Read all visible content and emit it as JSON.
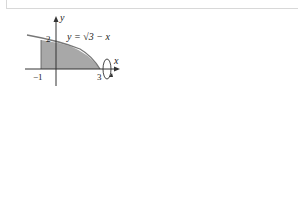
{
  "header": {
    "truncated_text": "...gure"
  },
  "figures": [
    {
      "number": "1.",
      "equation_label": "y = √(3 − x)",
      "axis_x_label": "x",
      "axis_y_label": "y",
      "tick_labels": {
        "x_neg": "−1",
        "x_pos": "3",
        "y": "2"
      },
      "rotation_axis": "x-axis",
      "region": "under y = √(3 − x) from x = −1 to x = 3"
    },
    {
      "number": "2.",
      "equation_labels": [
        "y = x",
        "y = 2 − x²"
      ],
      "axis_x_label": "x",
      "axis_y_label": "y",
      "tick_labels": {
        "x": "1",
        "y": "2"
      },
      "rotation_axis": "x-axis",
      "region": "between y = x and y = 2 − x² for 0 ≤ x ≤ 1"
    },
    {
      "number": "3.",
      "equation_label": "y = 3 − 2x",
      "axis_x_label": "x",
      "axis_y_label": "y",
      "tick_labels": {
        "x": "2",
        "y": "2"
      },
      "rotation_axis": "y-axis",
      "region": "under y = 3 − 2x, below y = 2, first quadrant"
    },
    {
      "number": "4.",
      "equation_label": "y = 1/x",
      "axis_x_label": "x",
      "axis_y_label": "y",
      "tick_labels": {
        "x": "2",
        "y": "2"
      },
      "rotation_axis": "y-axis",
      "region": "between y = 1/x and y = 2, x ≤ 2"
    }
  ]
}
